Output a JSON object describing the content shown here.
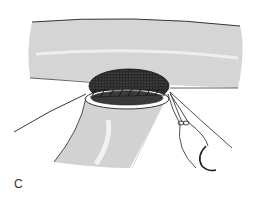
{
  "figure": {
    "panel_label": "C",
    "colors": {
      "ink": "#222222",
      "hatch": "#555555",
      "lumen_dark": "#333333",
      "background": "#ffffff"
    },
    "parts": [
      "recipient-vessel",
      "arteriotomy-lumen",
      "running-suture",
      "donor-vessel",
      "left-suture-thread",
      "right-suture-threads",
      "needle-holder",
      "curved-needle"
    ]
  }
}
